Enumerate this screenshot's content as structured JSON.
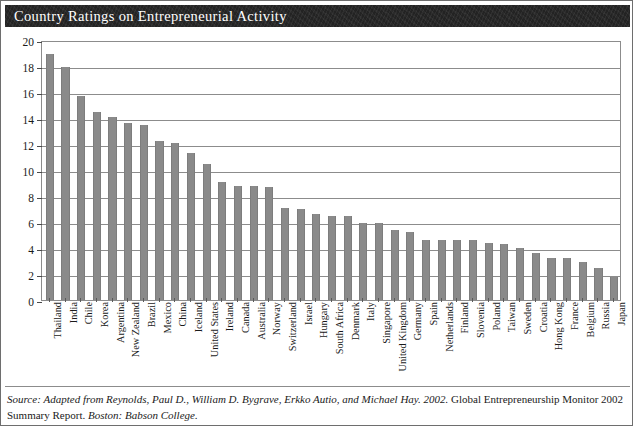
{
  "title": "Country Ratings on Entrepreneurial Activity",
  "source": {
    "label": "Source:",
    "italic_part": "Adapted from Reynolds, Paul D., William D. Bygrave, Erkko Autio, and Michael Hay. 2002.",
    "roman_part_1": "Global Entrepreneurship Monitor 2002 Summary Report.",
    "italic_part_2": "Boston: Babson College."
  },
  "colors": {
    "bar": "#8a8a8a",
    "header_bg": "#262626",
    "header_text": "#ffffff",
    "grid": "#8c8c8c",
    "frame": "#8c8c8c",
    "text": "#1a1a1a"
  },
  "chart_data": {
    "type": "bar",
    "title": "Country Ratings on Entrepreneurial Activity",
    "xlabel": "",
    "ylabel": "",
    "ylim": [
      0,
      20
    ],
    "ytick_labels": [
      "0",
      "2",
      "4",
      "6",
      "8",
      "10",
      "12",
      "14",
      "16",
      "18",
      "20"
    ],
    "ytick_values": [
      0,
      2,
      4,
      6,
      8,
      10,
      12,
      14,
      16,
      18,
      20
    ],
    "grid": true,
    "legend": null,
    "categories": [
      "Thailand",
      "India",
      "Chile",
      "Korea",
      "Argentina",
      "New Zealand",
      "Brazil",
      "Mexico",
      "China",
      "Iceland",
      "United States",
      "Ireland",
      "Canada",
      "Australia",
      "Norway",
      "Switzerland",
      "Israel",
      "Hungary",
      "South Africa",
      "Denmark",
      "Italy",
      "Singapore",
      "United Kingdom",
      "Germany",
      "Spain",
      "Netherlands",
      "Finland",
      "Slovenia",
      "Poland",
      "Taiwan",
      "Sweden",
      "Croatia",
      "Hong Kong",
      "France",
      "Belgium",
      "Russia",
      "Japan"
    ],
    "values": [
      18.9,
      17.9,
      15.7,
      14.5,
      14.1,
      13.6,
      13.5,
      12.2,
      12.1,
      11.3,
      10.5,
      9.1,
      8.8,
      8.8,
      8.7,
      7.1,
      7.0,
      6.6,
      6.5,
      6.5,
      5.9,
      5.9,
      5.4,
      5.2,
      4.6,
      4.6,
      4.6,
      4.6,
      4.4,
      4.3,
      4.0,
      3.6,
      3.2,
      3.2,
      2.9,
      2.5,
      1.8
    ]
  }
}
